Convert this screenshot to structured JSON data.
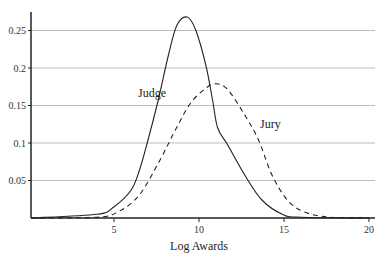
{
  "chart_data": {
    "type": "line",
    "title": "",
    "xlabel": "Log Awards",
    "ylabel": "",
    "xlim": [
      0,
      20
    ],
    "ylim": [
      0,
      0.27
    ],
    "x_ticks": [
      "5",
      "10",
      "15",
      "20"
    ],
    "y_ticks": [
      "0.05",
      "0.1",
      "0.15",
      "0.2",
      "0.25"
    ],
    "grid": "horizontal",
    "legend": "inline labels",
    "series": [
      {
        "name": "Judge",
        "style": "solid",
        "x": [
          0,
          4,
          5,
          6,
          6.5,
          7,
          7.6,
          8.2,
          8.7,
          9.3,
          9.8,
          10.4,
          10.8,
          11.1,
          11.7,
          12.7,
          13.7,
          14.9,
          16,
          20
        ],
        "y": [
          0,
          0.005,
          0.015,
          0.037,
          0.064,
          0.104,
          0.157,
          0.217,
          0.257,
          0.268,
          0.251,
          0.204,
          0.157,
          0.12,
          0.097,
          0.057,
          0.024,
          0.005,
          0.001,
          0
        ]
      },
      {
        "name": "Jury",
        "style": "dashed",
        "x": [
          0,
          4,
          5.3,
          6.5,
          7.7,
          8.6,
          9.5,
          10.4,
          11.0,
          11.7,
          12.7,
          13.5,
          14.3,
          15.2,
          16.2,
          17.7,
          20
        ],
        "y": [
          0,
          0.001,
          0.009,
          0.031,
          0.077,
          0.117,
          0.153,
          0.173,
          0.179,
          0.171,
          0.137,
          0.104,
          0.057,
          0.024,
          0.008,
          0.001,
          0
        ]
      }
    ],
    "annotations": [
      "Judge",
      "Jury"
    ]
  }
}
